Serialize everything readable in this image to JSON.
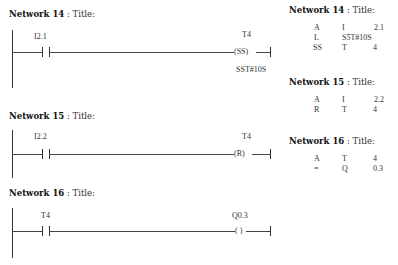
{
  "ladder": {
    "networks": [
      {
        "title_bold": "Network 14",
        "title_rest": " : Title:",
        "contact_label": "I2.1",
        "coil_label": "T4",
        "coil_symbol": "(SS)",
        "coil_param": "SST#10S"
      },
      {
        "title_bold": "Network 15",
        "title_rest": " : Title:",
        "contact_label": "I2.2",
        "coil_label": "T4",
        "coil_symbol": "(R)"
      },
      {
        "title_bold": "Network 16",
        "title_rest": " : Title:",
        "contact_label": "T4",
        "coil_label": "Q0.3",
        "coil_symbol": "( )"
      }
    ]
  },
  "stl": {
    "networks": [
      {
        "title_bold": "Network 14",
        "title_rest": " : Title:",
        "lines": [
          {
            "op": "A",
            "operand": "I",
            "addr": "2.1"
          },
          {
            "op": "L",
            "operand": "S5T#10S",
            "addr": ""
          },
          {
            "op": "SS",
            "operand": "T",
            "addr": "4"
          }
        ]
      },
      {
        "title_bold": "Network 15",
        "title_rest": " : Title:",
        "lines": [
          {
            "op": "A",
            "operand": "I",
            "addr": "2.2"
          },
          {
            "op": "R",
            "operand": "T",
            "addr": "4"
          }
        ]
      },
      {
        "title_bold": "Network 16",
        "title_rest": " : Title:",
        "lines": [
          {
            "op": "A",
            "operand": "T",
            "addr": "4"
          },
          {
            "op": "=",
            "operand": "Q",
            "addr": "0.3"
          }
        ]
      }
    ]
  }
}
